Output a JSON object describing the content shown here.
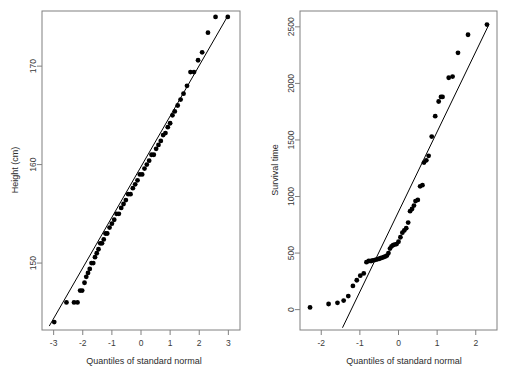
{
  "figure": {
    "width": 513,
    "height": 377,
    "background": "#ffffff",
    "point_color": "#000000",
    "line_color": "#000000",
    "frame_color": "#808080",
    "text_color": "#2b2b2b"
  },
  "chart_data": [
    {
      "type": "scatter",
      "title": "",
      "xlabel": "Quantiles of standard normal",
      "ylabel": "Height (cm)",
      "xlim": [
        -3.4,
        3.4
      ],
      "ylim": [
        143.2,
        175.6
      ],
      "xticks": [
        -3,
        -2,
        -1,
        0,
        1,
        2,
        3
      ],
      "xticklabels": [
        "-3",
        "-2",
        "-1",
        "0",
        "1",
        "2",
        "3"
      ],
      "yticks": [
        150,
        160,
        170
      ],
      "yticklabels": [
        "150",
        "160",
        "170"
      ],
      "grid": false,
      "legend": "none",
      "reference_line": {
        "x": [
          -3.15,
          3.0
        ],
        "y": [
          143.6,
          175.2
        ]
      },
      "x": [
        -2.98,
        -2.56,
        -2.3,
        -2.18,
        -2.09,
        -2.02,
        -1.94,
        -1.88,
        -1.82,
        -1.76,
        -1.7,
        -1.64,
        -1.58,
        -1.52,
        -1.46,
        -1.4,
        -1.34,
        -1.28,
        -1.22,
        -1.16,
        -1.08,
        -1.0,
        -0.92,
        -0.84,
        -0.76,
        -0.68,
        -0.6,
        -0.52,
        -0.44,
        -0.36,
        -0.28,
        -0.2,
        -0.12,
        -0.04,
        0.04,
        0.12,
        0.2,
        0.28,
        0.36,
        0.44,
        0.52,
        0.6,
        0.68,
        0.76,
        0.84,
        0.92,
        1.0,
        1.08,
        1.16,
        1.26,
        1.36,
        1.46,
        1.58,
        1.7,
        1.82,
        1.96,
        2.1,
        2.3,
        2.56,
        2.98
      ],
      "y": [
        144.0,
        146.0,
        146.0,
        146.0,
        147.2,
        147.2,
        148.0,
        148.6,
        149.0,
        149.4,
        150.0,
        150.0,
        150.6,
        151.0,
        151.4,
        152.0,
        152.0,
        152.4,
        153.0,
        153.0,
        153.6,
        154.0,
        154.4,
        155.0,
        155.0,
        155.6,
        156.0,
        156.4,
        157.0,
        157.0,
        157.6,
        158.0,
        158.4,
        159.0,
        159.0,
        159.6,
        160.0,
        160.4,
        161.0,
        161.0,
        161.6,
        162.0,
        162.4,
        163.0,
        163.2,
        163.8,
        164.2,
        165.0,
        165.4,
        166.0,
        166.6,
        167.2,
        168.0,
        169.4,
        169.4,
        170.6,
        171.4,
        173.4,
        175.0,
        175.0
      ]
    },
    {
      "type": "scatter",
      "title": "",
      "xlabel": "Quantiles of standard normal",
      "ylabel": "Survival time",
      "xlim": [
        -2.55,
        2.55
      ],
      "ylim": [
        -180,
        2640
      ],
      "xticks": [
        -2,
        -1,
        0,
        1,
        2
      ],
      "xticklabels": [
        "-2",
        "-1",
        "0",
        "1",
        "2"
      ],
      "yticks": [
        0,
        500,
        1000,
        1500,
        2000,
        2500
      ],
      "yticklabels": [
        "0",
        "500",
        "1000",
        "1500",
        "2000",
        "2500"
      ],
      "grid": false,
      "legend": "none",
      "reference_line": {
        "x": [
          -1.45,
          2.34
        ],
        "y": [
          -160,
          2520
        ]
      },
      "x": [
        -2.29,
        -1.81,
        -1.58,
        -1.42,
        -1.3,
        -1.18,
        -1.08,
        -0.99,
        -0.9,
        -0.83,
        -0.77,
        -0.71,
        -0.66,
        -0.6,
        -0.55,
        -0.5,
        -0.46,
        -0.42,
        -0.38,
        -0.34,
        -0.3,
        -0.26,
        -0.22,
        -0.18,
        -0.14,
        -0.1,
        -0.05,
        0.0,
        0.05,
        0.1,
        0.15,
        0.2,
        0.25,
        0.3,
        0.35,
        0.4,
        0.44,
        0.5,
        0.56,
        0.62,
        0.66,
        0.72,
        0.78,
        0.86,
        0.95,
        1.04,
        1.1,
        1.14,
        1.3,
        1.4,
        1.54,
        1.8,
        2.29
      ],
      "y": [
        20,
        50,
        60,
        80,
        120,
        210,
        260,
        300,
        320,
        420,
        430,
        430,
        435,
        440,
        445,
        450,
        455,
        460,
        465,
        470,
        478,
        500,
        540,
        560,
        570,
        575,
        580,
        600,
        640,
        680,
        700,
        720,
        770,
        870,
        890,
        920,
        960,
        970,
        1090,
        1100,
        1300,
        1320,
        1360,
        1530,
        1710,
        1840,
        1880,
        1880,
        2050,
        2060,
        2270,
        2430,
        2520
      ]
    }
  ]
}
